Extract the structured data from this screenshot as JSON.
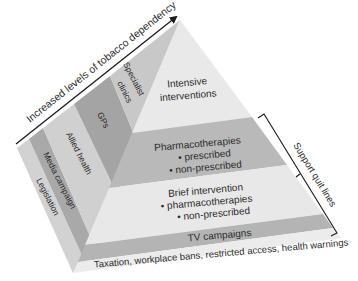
{
  "axis_arrow": {
    "label": "Increased levels of tobacco dependency"
  },
  "bracket": {
    "label": "Support quit lines"
  },
  "left_face": {
    "bands": [
      {
        "label": "Legislation",
        "color": "#d2d2d2"
      },
      {
        "label": "Media campaign",
        "color": "#a9a9a9"
      },
      {
        "label": "Allied health",
        "color": "#d0d0d0"
      },
      {
        "label": "GPs",
        "color": "#a4a4a4"
      },
      {
        "label": "Specialist clinics",
        "label_line1": "Specialist",
        "label_line2": "clinics",
        "color": "#c8c8c8"
      }
    ]
  },
  "front_face": {
    "tiers": [
      {
        "title": "Intensive",
        "title_line2": "interventions",
        "color": "#e9e9e9"
      },
      {
        "title": "Pharmacotherapies",
        "bullets": [
          "• prescribed",
          "• non-prescribed"
        ],
        "color": "#b9b9b9"
      },
      {
        "title": "Brief intervention",
        "bullets": [
          "• pharmacotherapies",
          "• non-prescribed"
        ],
        "color": "#e8e8e8"
      },
      {
        "title": "TV campaigns",
        "color": "#b4b4b4"
      },
      {
        "title": "Taxation, workplace bans, restricted access, health warnings",
        "color": "#ececec"
      }
    ]
  },
  "colors": {
    "line": "#1a1a1a",
    "text": "#2a2a2a",
    "background": "#ffffff"
  }
}
